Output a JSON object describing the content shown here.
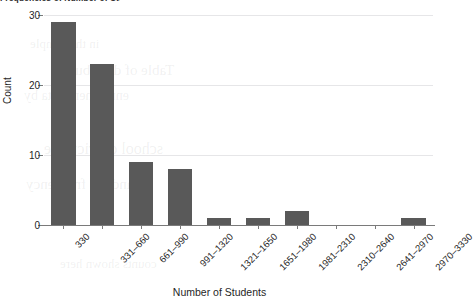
{
  "clipped_caption": {
    "text": "Frequencies of Number of Students"
  },
  "axis_titles": {
    "x": "Number of Students",
    "y": "Count"
  },
  "y_ticks": [
    "0",
    "10",
    "20",
    "30"
  ],
  "scan_ghost_text": [
    "in the sample",
    "Table of distribution",
    "enrollment data by",
    "school district size",
    "and the frequency",
    "counts shown here"
  ],
  "colors": {
    "bar": "#595959",
    "gridline": "#e6e6e8",
    "axis": "#7a7a7a",
    "background": "#ffffff",
    "text": "#1f1f1f"
  },
  "chart_data": {
    "type": "bar",
    "title": "Frequencies of Number of Students",
    "xlabel": "Number of Students",
    "ylabel": "Count",
    "categories": [
      "330",
      "331–660",
      "661–990",
      "991–1320",
      "1321–1650",
      "1651–1980",
      "1981–2310",
      "2310–2640",
      "2641–2970",
      "2970–3330"
    ],
    "values": [
      29,
      23,
      9,
      8,
      1,
      1,
      2,
      0,
      0,
      1
    ],
    "ylim": [
      0,
      30
    ],
    "yticks": [
      0,
      10,
      20,
      30
    ],
    "grid": "horizontal",
    "legend": "none",
    "orientation": "vertical"
  }
}
